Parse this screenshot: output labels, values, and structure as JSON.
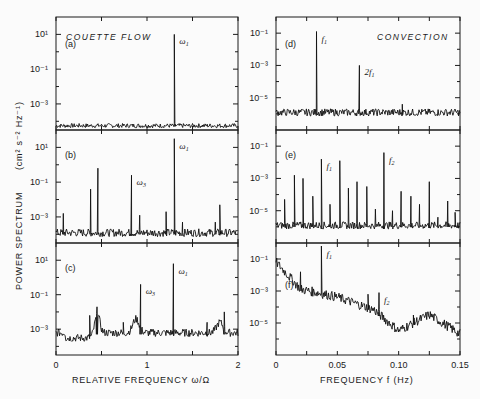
{
  "figure": {
    "ylabel_main": "POWER SPECTRUM",
    "ylabel_units": "(cm² s⁻² Hz⁻¹)",
    "left_xlabel": "RELATIVE FREQUENCY  ω/Ω",
    "right_xlabel": "FREQUENCY  f  (Hz)",
    "left_title": "COUETTE FLOW",
    "right_title": "CONVECTION",
    "left_xticks": [
      "0",
      "1",
      "2"
    ],
    "right_xticks": [
      "0",
      "0.05",
      "0.10",
      "0.15"
    ],
    "left_yticks": [
      "10¹",
      "10⁻¹",
      "10⁻³"
    ],
    "right_yticks": [
      "10⁻¹",
      "10⁻³",
      "10⁻⁵"
    ],
    "panels": {
      "a": {
        "letter": "(a)",
        "annotations": [
          "ω₁"
        ]
      },
      "b": {
        "letter": "(b)",
        "annotations": [
          "ω₁",
          "ω₃"
        ]
      },
      "c": {
        "letter": "(c)",
        "annotations": [
          "ω₁",
          "ω₃"
        ]
      },
      "d": {
        "letter": "(d)",
        "annotations": [
          "f₁",
          "2f₁"
        ]
      },
      "e": {
        "letter": "(e)",
        "annotations": [
          "f₁",
          "f₂"
        ]
      },
      "f": {
        "letter": "(f)",
        "annotations": [
          "f₁",
          "f₂"
        ]
      }
    }
  },
  "chart_data": [
    {
      "type": "line",
      "panel": "(a)",
      "title": "COUETTE FLOW",
      "xlabel": "RELATIVE FREQUENCY ω/Ω",
      "ylabel": "POWER SPECTRUM (cm² s⁻² Hz⁻¹)",
      "xlim": [
        0,
        2
      ],
      "ylim_log10": [
        -4.5,
        2
      ],
      "yscale": "log",
      "noise_floor_log10": -4.3,
      "peaks": [
        {
          "x": 1.3,
          "log10_y": 1.0,
          "label": "ω₁"
        }
      ]
    },
    {
      "type": "line",
      "panel": "(b)",
      "xlabel": "RELATIVE FREQUENCY ω/Ω",
      "xlim": [
        0,
        2
      ],
      "ylim_log10": [
        -4.5,
        2
      ],
      "yscale": "log",
      "noise_floor_log10": -4.0,
      "peaks": [
        {
          "x": 0.08,
          "log10_y": -2.8
        },
        {
          "x": 0.38,
          "log10_y": -1.4
        },
        {
          "x": 0.46,
          "log10_y": -0.2
        },
        {
          "x": 0.83,
          "log10_y": -0.6,
          "label": "ω₃"
        },
        {
          "x": 0.92,
          "log10_y": -2.9
        },
        {
          "x": 1.21,
          "log10_y": -2.7
        },
        {
          "x": 1.3,
          "log10_y": 1.5,
          "label": "ω₁"
        },
        {
          "x": 1.39,
          "log10_y": -3.3
        },
        {
          "x": 1.75,
          "log10_y": -3.3
        },
        {
          "x": 1.8,
          "log10_y": -2.3
        }
      ]
    },
    {
      "type": "line",
      "panel": "(c)",
      "xlabel": "RELATIVE FREQUENCY ω/Ω",
      "xlim": [
        0,
        2
      ],
      "ylim_log10": [
        -4.5,
        2
      ],
      "yscale": "log",
      "noise_floor_log10": -3.3,
      "peaks": [
        {
          "x": 0.37,
          "log10_y": -2.2
        },
        {
          "x": 0.45,
          "log10_y": -1.7
        },
        {
          "x": 0.74,
          "log10_y": -2.6
        },
        {
          "x": 0.93,
          "log10_y": -0.4,
          "label": "ω₃"
        },
        {
          "x": 1.29,
          "log10_y": 0.8,
          "label": "ω₁"
        },
        {
          "x": 1.66,
          "log10_y": -2.6
        },
        {
          "x": 1.85,
          "log10_y": -2.0
        }
      ]
    },
    {
      "type": "line",
      "panel": "(d)",
      "title": "CONVECTION",
      "xlabel": "FREQUENCY f (Hz)",
      "xlim": [
        0,
        0.15
      ],
      "ylim_log10": [
        -7,
        0
      ],
      "yscale": "log",
      "noise_floor_log10": -6.0,
      "peaks": [
        {
          "x": 0.033,
          "log10_y": -0.9,
          "label": "f₁"
        },
        {
          "x": 0.068,
          "log10_y": -3.0,
          "label": "2f₁"
        },
        {
          "x": 0.103,
          "log10_y": -5.4
        }
      ]
    },
    {
      "type": "line",
      "panel": "(e)",
      "xlabel": "FREQUENCY f (Hz)",
      "xlim": [
        0,
        0.15
      ],
      "ylim_log10": [
        -7,
        0
      ],
      "yscale": "log",
      "noise_floor_log10": -6.0,
      "peaks": [
        {
          "x": 0.007,
          "log10_y": -4.3
        },
        {
          "x": 0.015,
          "log10_y": -2.8
        },
        {
          "x": 0.022,
          "log10_y": -3.0
        },
        {
          "x": 0.03,
          "log10_y": -4.1
        },
        {
          "x": 0.037,
          "log10_y": -1.8,
          "label": "f₁"
        },
        {
          "x": 0.044,
          "log10_y": -4.6
        },
        {
          "x": 0.052,
          "log10_y": -1.9
        },
        {
          "x": 0.059,
          "log10_y": -3.6
        },
        {
          "x": 0.066,
          "log10_y": -3.2
        },
        {
          "x": 0.074,
          "log10_y": -3.5
        },
        {
          "x": 0.081,
          "log10_y": -4.9
        },
        {
          "x": 0.088,
          "log10_y": -1.4,
          "label": "f₂"
        },
        {
          "x": 0.095,
          "log10_y": -5.0
        },
        {
          "x": 0.102,
          "log10_y": -3.8
        },
        {
          "x": 0.11,
          "log10_y": -4.1
        },
        {
          "x": 0.117,
          "log10_y": -4.6
        },
        {
          "x": 0.125,
          "log10_y": -3.2
        },
        {
          "x": 0.132,
          "log10_y": -5.4
        },
        {
          "x": 0.14,
          "log10_y": -4.4
        },
        {
          "x": 0.146,
          "log10_y": -5.1
        }
      ]
    },
    {
      "type": "line",
      "panel": "(f)",
      "xlabel": "FREQUENCY f (Hz)",
      "xlim": [
        0,
        0.15
      ],
      "ylim_log10": [
        -7,
        0
      ],
      "yscale": "log",
      "broadband_decay_log10": [
        [
          0,
          -1.3
        ],
        [
          0.02,
          -3.0
        ],
        [
          0.05,
          -3.5
        ],
        [
          0.08,
          -4.3
        ],
        [
          0.1,
          -5.6
        ],
        [
          0.125,
          -4.6
        ],
        [
          0.15,
          -5.8
        ]
      ],
      "peaks": [
        {
          "x": 0.02,
          "log10_y": -1.8
        },
        {
          "x": 0.037,
          "log10_y": 0.0,
          "label": "f₁"
        },
        {
          "x": 0.075,
          "log10_y": -3.2
        },
        {
          "x": 0.084,
          "log10_y": -3.1,
          "label": "f₂"
        },
        {
          "x": 0.112,
          "log10_y": -4.5
        },
        {
          "x": 0.125,
          "log10_y": -4.6
        }
      ]
    }
  ]
}
